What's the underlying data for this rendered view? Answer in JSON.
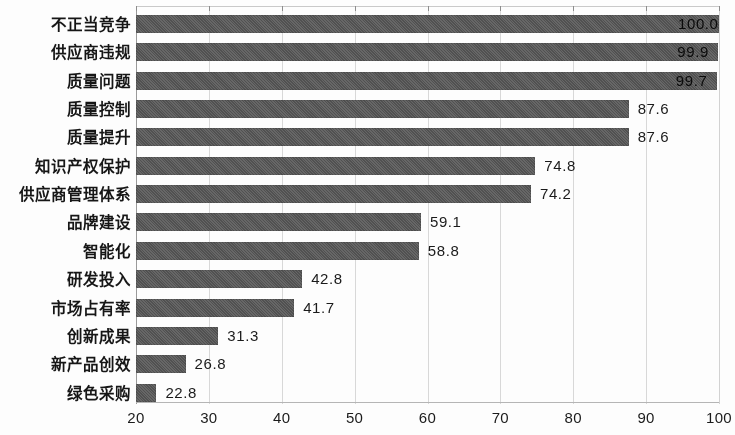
{
  "chart_data": {
    "type": "bar",
    "orientation": "horizontal",
    "title": "",
    "subtitle": "",
    "xlabel": "",
    "ylabel": "",
    "xlim": [
      20,
      100
    ],
    "xticks": [
      20,
      30,
      40,
      50,
      60,
      70,
      80,
      90,
      100
    ],
    "xtick_labels": [
      "20",
      "30",
      "40",
      "50",
      "60",
      "70",
      "80",
      "90",
      "100"
    ],
    "grid": true,
    "grid_axis": "x",
    "legend": false,
    "legend_position": "none",
    "bar_color": "#565656",
    "categories": [
      "不正当竞争",
      "供应商违规",
      "质量问题",
      "质量控制",
      "质量提升",
      "知识产权保护",
      "供应商管理体系",
      "品牌建设",
      "智能化",
      "研发投入",
      "市场占有率",
      "创新成果",
      "新产品创效",
      "绿色采购"
    ],
    "values": [
      100.0,
      99.9,
      99.7,
      87.6,
      87.6,
      74.8,
      74.2,
      59.1,
      58.8,
      42.8,
      41.7,
      31.3,
      26.8,
      22.8
    ],
    "value_labels": [
      "100.0",
      "99.9",
      "99.7",
      "87.6",
      "87.6",
      "74.8",
      "74.2",
      "59.1",
      "58.8",
      "42.8",
      "41.7",
      "31.3",
      "26.8",
      "22.8"
    ],
    "data_labels_shown": true,
    "data_label_position": "outside-end"
  }
}
